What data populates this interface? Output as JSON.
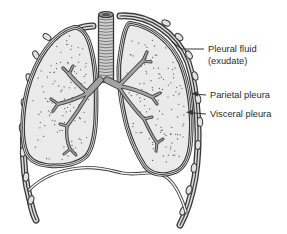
{
  "figure": {
    "labels": {
      "pleural_fluid_line1": "Pleural fluid",
      "pleural_fluid_line2": "(exudate)",
      "parietal_pleura": "Parietal pleura",
      "visceral_pleura": "Visceral pleura"
    },
    "colors": {
      "background": "#ffffff",
      "outline": "#383838",
      "lung_fill": "#eaeaea",
      "pleura_gap": "#dcdcdc",
      "fluid_gap": "#f3f3f3",
      "bronchi": "#a3a3a3",
      "trachea_fill": "#cfcfcf",
      "rib_fill": "#e2e2e2",
      "stipple": "#606060",
      "label_text": "#2a2a2a"
    }
  }
}
